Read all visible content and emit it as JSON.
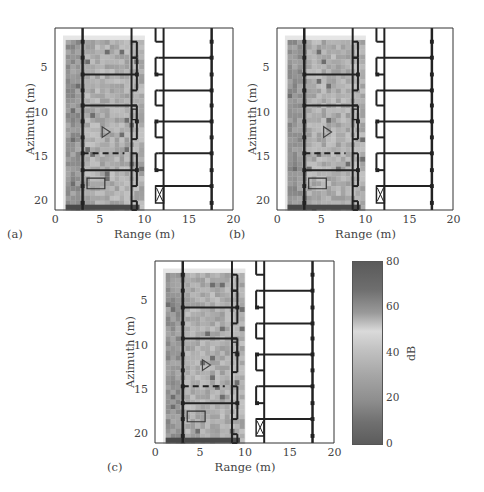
{
  "figure": {
    "panels": [
      {
        "id": "a",
        "tag": "(a)",
        "frame": {
          "left": 55,
          "top": 28,
          "width": 178,
          "height": 182
        }
      },
      {
        "id": "b",
        "tag": "(b)",
        "frame": {
          "left": 277,
          "top": 28,
          "width": 176,
          "height": 182
        }
      },
      {
        "id": "c",
        "tag": "(c)",
        "frame": {
          "left": 155,
          "top": 261,
          "width": 179,
          "height": 182
        }
      }
    ],
    "xlabel": "Range (m)",
    "ylabel": "Azimuth (m)",
    "xticks": [
      "0",
      "5",
      "10",
      "15",
      "20"
    ],
    "yticks": [
      "5",
      "10",
      "15",
      "20"
    ],
    "colorbar": {
      "title": "dB",
      "ticks": [
        "80",
        "60",
        "40",
        "20",
        "0"
      ],
      "colors": [
        "#5a5a5a",
        "#7a7a7a",
        "#d8d8d8",
        "#a8a8a8",
        "#8a8a8a",
        "#5c5c5c"
      ]
    }
  },
  "chart_data": [
    {
      "type": "heatmap",
      "title": "(a)",
      "xlabel": "Range (m)",
      "ylabel": "Azimuth (m)",
      "xlim": [
        0,
        20
      ],
      "ylim": [
        21,
        0.5
      ],
      "xticks": [
        0,
        5,
        10,
        15,
        20
      ],
      "yticks": [
        5,
        10,
        15,
        20
      ],
      "image_extent": {
        "x": [
          1.2,
          9.5
        ],
        "y": [
          1.8,
          21
        ]
      },
      "overlay": "building floor plan (walls, doors, triangle target marker, rectangle object)",
      "target_marker": {
        "shape": "triangle",
        "x": 5.8,
        "y": 12.2
      },
      "colorbar_range_db": [
        0,
        80
      ]
    },
    {
      "type": "heatmap",
      "title": "(b)",
      "xlabel": "Range (m)",
      "ylabel": "Azimuth (m)",
      "xlim": [
        0,
        20
      ],
      "ylim": [
        21,
        0.5
      ],
      "xticks": [
        0,
        5,
        10,
        15,
        20
      ],
      "yticks": [
        5,
        10,
        15,
        20
      ],
      "image_extent": {
        "x": [
          1.2,
          9.5
        ],
        "y": [
          1.8,
          21
        ]
      },
      "target_marker": {
        "shape": "triangle",
        "x": 5.8,
        "y": 12.2
      },
      "colorbar_range_db": [
        0,
        80
      ]
    },
    {
      "type": "heatmap",
      "title": "(c)",
      "xlabel": "Range (m)",
      "ylabel": "Azimuth (m)",
      "xlim": [
        0,
        20
      ],
      "ylim": [
        21,
        0.5
      ],
      "xticks": [
        0,
        5,
        10,
        15,
        20
      ],
      "yticks": [
        5,
        10,
        15,
        20
      ],
      "image_extent": {
        "x": [
          1.2,
          9.5
        ],
        "y": [
          1.8,
          21
        ]
      },
      "target_marker": {
        "shape": "triangle",
        "x": 5.8,
        "y": 12.2
      },
      "colorbar": {
        "label": "dB",
        "ticks": [
          0,
          20,
          40,
          60,
          80
        ],
        "range": [
          0,
          80
        ]
      }
    }
  ]
}
